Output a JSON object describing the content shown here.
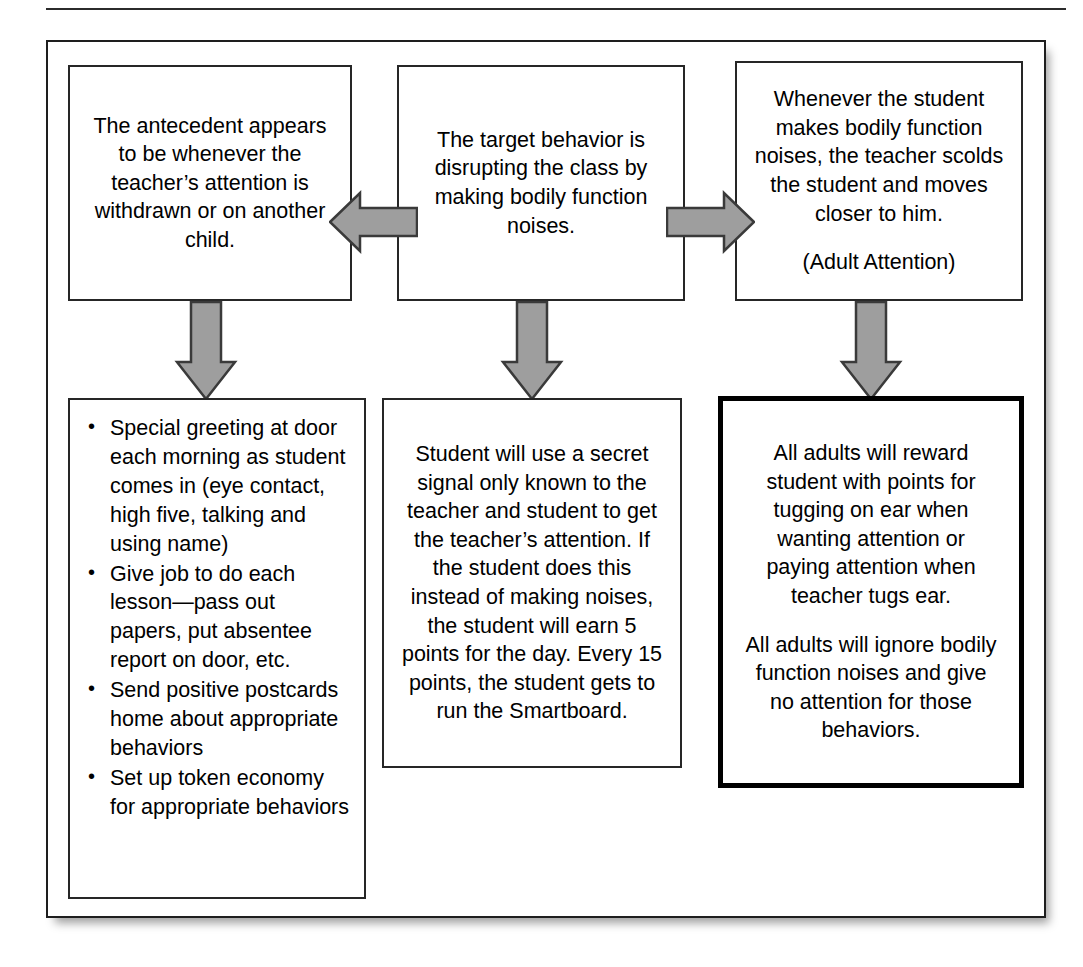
{
  "diagram": {
    "type": "competing-behavior-pathway-flowchart",
    "colors": {
      "arrow_fill": "#9e9e9e",
      "arrow_stroke": "#3a3a3a",
      "box_border": "#262626",
      "emphasis_box_border": "#000000",
      "background": "#ffffff"
    },
    "nodes": {
      "antecedent": {
        "text": "The antecedent appears to be whenever the teacher’s attention is withdrawn or on another child."
      },
      "behavior": {
        "text": "The target behavior is disrupting the class by making bodily function noises."
      },
      "consequence": {
        "text": "Whenever the student makes bodily function noises, the teacher scolds the student and moves closer to him.",
        "note": "(Adult Attention)"
      },
      "antecedent_strategies": {
        "bullets": [
          "Special greeting at door each morning as student comes in (eye contact, high five, talking and using name)",
          "Give job to do each lesson—pass out papers, put absentee report on door, etc.",
          "Send positive postcards home about appropriate behaviors",
          "Set up token economy for appropriate behaviors"
        ]
      },
      "replacement_behavior": {
        "text": "Student will use a secret signal only known to the teacher and student to get the teacher’s attention.  If the student does this instead of making noises, the student will earn 5 points for the day.  Every 15 points, the student gets to run the Smartboard."
      },
      "consequence_strategies": {
        "paragraph_1": "All adults will reward student with points for tugging on ear when wanting attention or paying attention when teacher tugs ear.",
        "paragraph_2": "All adults will ignore bodily function noises and give no attention for those behaviors."
      }
    },
    "arrows": {
      "behavior_to_antecedent": "arrow-left-icon",
      "behavior_to_consequence": "arrow-right-icon",
      "antecedent_down": "arrow-down-icon",
      "behavior_down": "arrow-down-icon",
      "consequence_down": "arrow-down-icon"
    }
  }
}
